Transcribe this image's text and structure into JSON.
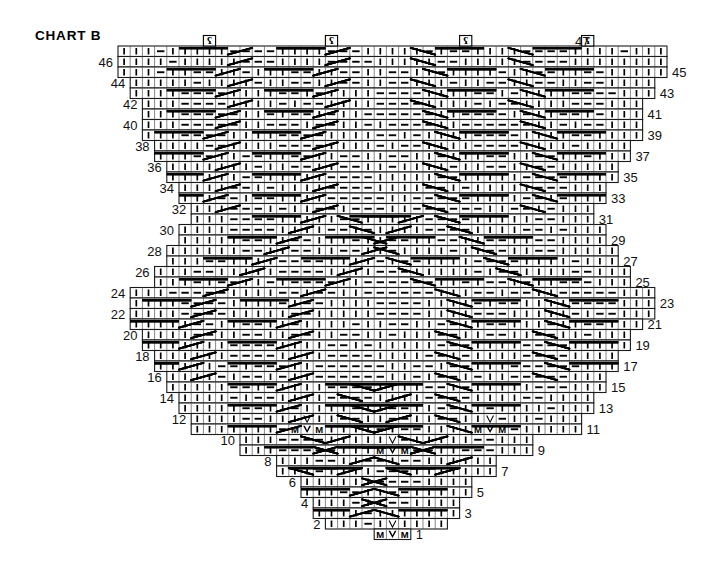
{
  "title": "CHART B",
  "chart_data": {
    "type": "table",
    "title": "CHART B",
    "rows_total": 47,
    "max_columns": 45,
    "xlabel": "",
    "ylabel": "",
    "grid": true,
    "legend_position": "none",
    "cell_px": {
      "w": 12.2,
      "h": 10.5
    },
    "origin_px": {
      "x": 118,
      "y": 46
    },
    "row_numbers_left": [
      46,
      44,
      42,
      40,
      38,
      36,
      34,
      32,
      30,
      28,
      26,
      24,
      22,
      20,
      18,
      16,
      14,
      12,
      10,
      8,
      6,
      4,
      2
    ],
    "row_numbers_right": [
      47,
      45,
      43,
      41,
      39,
      37,
      35,
      33,
      31,
      29,
      27,
      25,
      23,
      21,
      19,
      17,
      15,
      13,
      11,
      9,
      7,
      5,
      3,
      1
    ],
    "symbols": {
      "knit": "|",
      "purl": "—",
      "make_one": "M",
      "centered_double_decrease": "V",
      "twisted_yarnover": "ʕ",
      "travelling_stitch": "diagonal-line"
    },
    "notes": [
      "Row 1 (bottom tip) is 3 stitches wide: M, V, M.",
      "Rows grow by one stitch at each edge every 2 rows producing the triangular outline.",
      "M V M groups also occur in rows 9 and 11 at two mirrored positions.",
      "Four twisted-stitch symbols sit above the chart top edge at row 47."
    ]
  },
  "row_extents": [
    {
      "row": 47,
      "start": 0,
      "width": 45
    },
    {
      "row": 46,
      "start": 0,
      "width": 45
    },
    {
      "row": 45,
      "start": 0,
      "width": 45
    },
    {
      "row": 44,
      "start": 1,
      "width": 43
    },
    {
      "row": 43,
      "start": 1,
      "width": 43
    },
    {
      "row": 42,
      "start": 2,
      "width": 41
    },
    {
      "row": 41,
      "start": 2,
      "width": 41
    },
    {
      "row": 40,
      "start": 2,
      "width": 41
    },
    {
      "row": 39,
      "start": 2,
      "width": 41
    },
    {
      "row": 38,
      "start": 3,
      "width": 39
    },
    {
      "row": 37,
      "start": 3,
      "width": 39
    },
    {
      "row": 36,
      "start": 4,
      "width": 37
    },
    {
      "row": 35,
      "start": 4,
      "width": 37
    },
    {
      "row": 34,
      "start": 5,
      "width": 35
    },
    {
      "row": 33,
      "start": 5,
      "width": 35
    },
    {
      "row": 32,
      "start": 6,
      "width": 33
    },
    {
      "row": 31,
      "start": 6,
      "width": 33
    },
    {
      "row": 30,
      "start": 5,
      "width": 35
    },
    {
      "row": 29,
      "start": 5,
      "width": 35
    },
    {
      "row": 28,
      "start": 4,
      "width": 37
    },
    {
      "row": 27,
      "start": 4,
      "width": 37
    },
    {
      "row": 26,
      "start": 3,
      "width": 39
    },
    {
      "row": 25,
      "start": 3,
      "width": 39
    },
    {
      "row": 24,
      "start": 1,
      "width": 43
    },
    {
      "row": 23,
      "start": 1,
      "width": 43
    },
    {
      "row": 22,
      "start": 1,
      "width": 43
    },
    {
      "row": 21,
      "start": 1,
      "width": 42
    },
    {
      "row": 20,
      "start": 2,
      "width": 40
    },
    {
      "row": 19,
      "start": 2,
      "width": 40
    },
    {
      "row": 18,
      "start": 3,
      "width": 38
    },
    {
      "row": 17,
      "start": 3,
      "width": 38
    },
    {
      "row": 16,
      "start": 4,
      "width": 36
    },
    {
      "row": 15,
      "start": 4,
      "width": 36
    },
    {
      "row": 14,
      "start": 5,
      "width": 34
    },
    {
      "row": 13,
      "start": 5,
      "width": 34
    },
    {
      "row": 12,
      "start": 6,
      "width": 32
    },
    {
      "row": 11,
      "start": 6,
      "width": 32
    },
    {
      "row": 10,
      "start": 10,
      "width": 24
    },
    {
      "row": 9,
      "start": 10,
      "width": 24
    },
    {
      "row": 8,
      "start": 13,
      "width": 18
    },
    {
      "row": 7,
      "start": 13,
      "width": 18
    },
    {
      "row": 6,
      "start": 15,
      "width": 14
    },
    {
      "row": 5,
      "start": 15,
      "width": 14
    },
    {
      "row": 4,
      "start": 16,
      "width": 12
    },
    {
      "row": 3,
      "start": 16,
      "width": 12
    },
    {
      "row": 2,
      "start": 17,
      "width": 10
    },
    {
      "row": 1,
      "start": 21,
      "width": 3
    }
  ],
  "colors": {
    "ink": "#000000",
    "grid": "#1a1a1a",
    "background": "#ffffff"
  }
}
